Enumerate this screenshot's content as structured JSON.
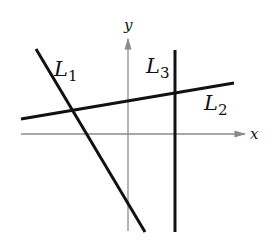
{
  "diagram": {
    "type": "coordinate-plane-lines",
    "axes": {
      "x_label": "x",
      "y_label": "y",
      "axis_color": "#8a8a8a"
    },
    "lines": [
      {
        "name": "L1",
        "label_main": "L",
        "label_sub": "1",
        "description": "steep negative slope line",
        "color": "#111111"
      },
      {
        "name": "L2",
        "label_main": "L",
        "label_sub": "2",
        "description": "shallow positive slope line",
        "color": "#111111"
      },
      {
        "name": "L3",
        "label_main": "L",
        "label_sub": "3",
        "description": "vertical line",
        "color": "#111111"
      }
    ]
  }
}
